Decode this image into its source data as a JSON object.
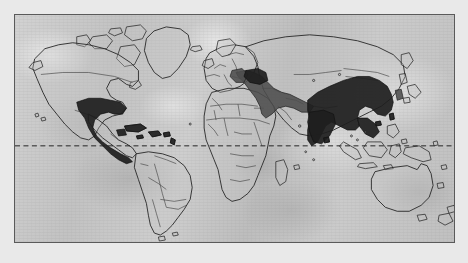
{
  "figure": {
    "type": "world-distribution-map",
    "projection": "equirectangular",
    "frame": {
      "x": 14,
      "y": 14,
      "width": 441,
      "height": 229,
      "border_color": "#5a5a5a"
    },
    "background_color": "#e9e9e9",
    "ocean_color": "#c6c6c6",
    "land_outline_color": "#262626",
    "country_border_color": "#3a3a3a"
  },
  "reference_lines": [
    {
      "name": "equator",
      "label": "Equator",
      "latitude": 0,
      "style": "dashed",
      "color": "#1c1c1c",
      "y_position_px": 146
    }
  ],
  "legend_colors": {
    "range_dark": "#1e1e1e",
    "range_mid": "#4d4d4d",
    "land": "#c8c8c8"
  },
  "distribution_regions": [
    {
      "id": "neotropic-range",
      "label": "Southern North America, Mexico, Central America and Caribbean",
      "shade": "range-dark",
      "continents": [
        "North America",
        "Central America",
        "Caribbean"
      ]
    },
    {
      "id": "mediterranean-middle-east-range",
      "label": "Balkans, Anatolia, Levant, Arabian Peninsula and Iran",
      "shade": "range-mid",
      "continents": [
        "Europe",
        "Asia"
      ]
    },
    {
      "id": "south-east-asia-range",
      "label": "Indian subcontinent, China and Southeast Asia",
      "shade": "range-dark",
      "continents": [
        "Asia"
      ]
    }
  ],
  "unshaded_continents": [
    "Greenland",
    "Canada",
    "Northern United States",
    "South America",
    "Africa",
    "Northern Europe",
    "Siberia",
    "Indonesia",
    "New Guinea",
    "Australia",
    "New Zealand",
    "Japan"
  ]
}
